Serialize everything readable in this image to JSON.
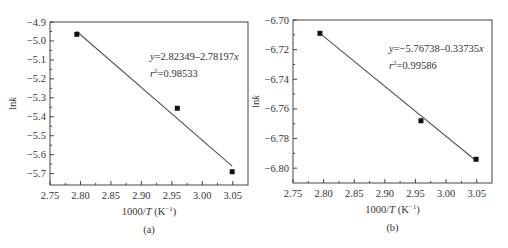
{
  "chart_data": [
    {
      "id": "a",
      "type": "scatter",
      "panel_label": "(a)",
      "xlabel": "1000/T (K⁻¹)",
      "ylabel": "lnk",
      "xlim": [
        2.75,
        3.075
      ],
      "ylim": [
        -5.76,
        -4.9
      ],
      "xticks": [
        2.75,
        2.8,
        2.85,
        2.9,
        2.95,
        3.0,
        3.05
      ],
      "xtick_labels": [
        "2.75",
        "2.80",
        "2.85",
        "2.90",
        "2.95",
        "3.00",
        "3.05"
      ],
      "yticks": [
        -4.9,
        -5.0,
        -5.1,
        -5.2,
        -5.3,
        -5.4,
        -5.5,
        -5.6,
        -5.7
      ],
      "ytick_labels": [
        "-4.9",
        "-5.0",
        "-5.1",
        "-5.2",
        "-5.3",
        "-5.4",
        "-5.5",
        "-5.6",
        "-5.7"
      ],
      "grid": false,
      "series": [
        {
          "name": "data",
          "marker": "square",
          "x": [
            2.794,
            2.959,
            3.049
          ],
          "y": [
            -4.965,
            -5.355,
            -5.69
          ]
        },
        {
          "name": "fit",
          "line": true,
          "x": [
            2.794,
            3.049
          ],
          "y": [
            -4.95,
            -5.66
          ]
        }
      ],
      "annotations": {
        "equation_prefix": "y",
        "equation_body": "=2.82349–2.78197",
        "equation_var": "x",
        "r2_prefix": "r",
        "r2_sup": "2",
        "r2_body": "=0.98533"
      }
    },
    {
      "id": "b",
      "type": "scatter",
      "panel_label": "(b)",
      "xlabel": "1000/T (K⁻¹)",
      "ylabel": "lnk",
      "xlim": [
        2.75,
        3.075
      ],
      "ylim": [
        -6.81,
        -6.7
      ],
      "xticks": [
        2.75,
        2.8,
        2.85,
        2.9,
        2.95,
        3.0,
        3.05
      ],
      "xtick_labels": [
        "2.75",
        "2.80",
        "2.85",
        "2.90",
        "2.95",
        "3.00",
        "3.05"
      ],
      "yticks": [
        -6.7,
        -6.72,
        -6.74,
        -6.76,
        -6.78,
        -6.8
      ],
      "ytick_labels": [
        "-6.70",
        "-6.72",
        "-6.74",
        "-6.76",
        "-6.78",
        "-6.80"
      ],
      "grid": false,
      "series": [
        {
          "name": "data",
          "marker": "square",
          "x": [
            2.794,
            2.959,
            3.049
          ],
          "y": [
            -6.709,
            -6.768,
            -6.794
          ]
        },
        {
          "name": "fit",
          "line": true,
          "x": [
            2.794,
            3.049
          ],
          "y": [
            -6.709,
            -6.795
          ]
        }
      ],
      "annotations": {
        "equation_prefix": "y",
        "equation_body": "=−5.76738–0.33735",
        "equation_var": "x",
        "r2_prefix": "r",
        "r2_sup": "2",
        "r2_body": "=0.99586"
      }
    }
  ],
  "layout": {
    "panels": [
      {
        "left": 50,
        "right": 248,
        "top": 22,
        "bottom": 185
      },
      {
        "left": 293,
        "right": 492,
        "top": 20,
        "bottom": 183
      }
    ]
  }
}
